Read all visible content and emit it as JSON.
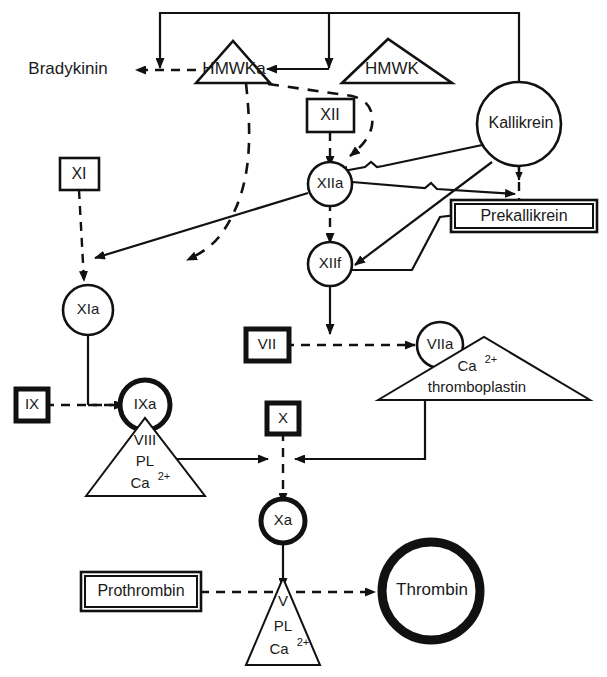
{
  "diagram": {
    "background_color": "#ffffff",
    "line_color": "#111111",
    "nodes": {
      "bradykinin": {
        "label": "Bradykinin",
        "shape": "text"
      },
      "hmwka": {
        "label": "HMWKa",
        "shape": "triangle"
      },
      "hmwk": {
        "label": "HMWK",
        "shape": "triangle"
      },
      "kallikrein": {
        "label": "Kallikrein",
        "shape": "circle"
      },
      "factor_xii": {
        "label": "XII",
        "shape": "box"
      },
      "factor_xiia": {
        "label": "XIIa",
        "shape": "circle"
      },
      "factor_xiif": {
        "label": "XIIf",
        "shape": "circle"
      },
      "prekallikrein": {
        "label": "Prekallikrein",
        "shape": "box"
      },
      "factor_xi": {
        "label": "XI",
        "shape": "box"
      },
      "factor_xia": {
        "label": "XIa",
        "shape": "circle"
      },
      "factor_ix": {
        "label": "IX",
        "shape": "box"
      },
      "factor_ixa": {
        "label": "IXa",
        "shape": "circle-bold"
      },
      "factor_vii": {
        "label": "VII",
        "shape": "box-bold"
      },
      "factor_viia": {
        "label": "VIIa",
        "shape": "circle"
      },
      "factor_x": {
        "label": "X",
        "shape": "box"
      },
      "factor_xa": {
        "label": "Xa",
        "shape": "circle-bold"
      },
      "prothrombin": {
        "label": "Prothrombin",
        "shape": "box"
      },
      "thrombin": {
        "label": "Thrombin",
        "shape": "circle-xbold"
      }
    },
    "complexes": {
      "tissue_factor": {
        "shape": "triangle-wide",
        "line1": "Ca",
        "line1_sup": "2+",
        "line2": "thromboplastin"
      },
      "tenase": {
        "shape": "triangle",
        "line1": "VIII",
        "line2": "PL",
        "line3": "Ca",
        "line3_sup": "2+"
      },
      "prothrombinase": {
        "shape": "triangle-narrow",
        "line1": "V",
        "line2": "PL",
        "line3": "Ca",
        "line3_sup": "2+"
      }
    }
  }
}
